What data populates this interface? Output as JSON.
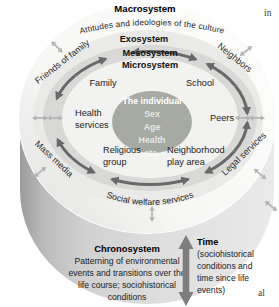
{
  "colors": {
    "center_ellipse": "#a6aaa3",
    "macrosystem_band": "#f6f6f4",
    "exosystem_band": "#eaeae8",
    "mesosystem_band": "#d8d8d6",
    "microsystem_band": "#f2f2f0",
    "cylinder_face": "#d9d9d9",
    "cycle_arrow": "#696969",
    "exchange_arrow": "#b4b4b4",
    "time_arrow": "#7d7d7d"
  },
  "rings": {
    "macrosystem": {
      "label": "Macrosystem",
      "description": "Attitudes and ideologies of the culture"
    },
    "exosystem": {
      "label": "Exosystem"
    },
    "mesosystem": {
      "label": "Mesosystem"
    },
    "microsystem": {
      "label": "Microsystem"
    }
  },
  "individual": {
    "title": "The individual",
    "attributes": [
      "Sex",
      "Age",
      "Health",
      "etc."
    ]
  },
  "microsystem_items": {
    "family": "Family",
    "school": "School",
    "health_line1": "Health",
    "health_line2": "services",
    "peers": "Peers",
    "religious_line1": "Religious",
    "religious_line2": "group",
    "neighborhood_line1": "Neighborhood",
    "neighborhood_line2": "play area"
  },
  "exosystem_items": {
    "friends_of_family": "Friends of family",
    "neighbors": "Neighbors",
    "mass_media": "Mass media",
    "legal_services": "Legal services",
    "social_welfare": "Social welfare services"
  },
  "chronosystem": {
    "label": "Chronosystem",
    "line1": "Patterning of environmental",
    "line2": "events and transitions over the",
    "line3": "life course; sociohistorical",
    "line4": "conditions"
  },
  "time": {
    "label": "Time",
    "line1": "(sociohistorical",
    "line2": "conditions and",
    "line3": "time since life",
    "line4": "events)"
  },
  "page_fragments": {
    "top_right": "in",
    "bottom_right": "al"
  }
}
